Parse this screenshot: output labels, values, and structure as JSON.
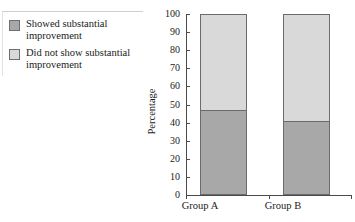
{
  "legend": {
    "items": [
      {
        "swatch": "dark",
        "color": "#a8a8a8",
        "label": "Showed substantial improvement"
      },
      {
        "swatch": "light",
        "color": "#d9d9d9",
        "label": "Did not show substantial improvement"
      }
    ]
  },
  "axes": {
    "ylabel": "Percentage",
    "yticks": [
      "100",
      "90",
      "80",
      "70",
      "60",
      "50",
      "40",
      "30",
      "20",
      "10",
      "0"
    ],
    "xticklabels": [
      "Group A",
      "Group B"
    ]
  },
  "chart_data": {
    "type": "bar",
    "title": "",
    "xlabel": "",
    "ylabel": "Percentage",
    "ylim": [
      0,
      100
    ],
    "ytick_step": 10,
    "grid": false,
    "stacked": true,
    "legend_position": "upper-left-outside",
    "categories": [
      "Group A",
      "Group B"
    ],
    "series": [
      {
        "name": "Showed substantial improvement",
        "color": "#a8a8a8",
        "values": [
          47,
          41
        ]
      },
      {
        "name": "Did not show substantial improvement",
        "color": "#d9d9d9",
        "values": [
          53,
          59
        ]
      }
    ]
  }
}
